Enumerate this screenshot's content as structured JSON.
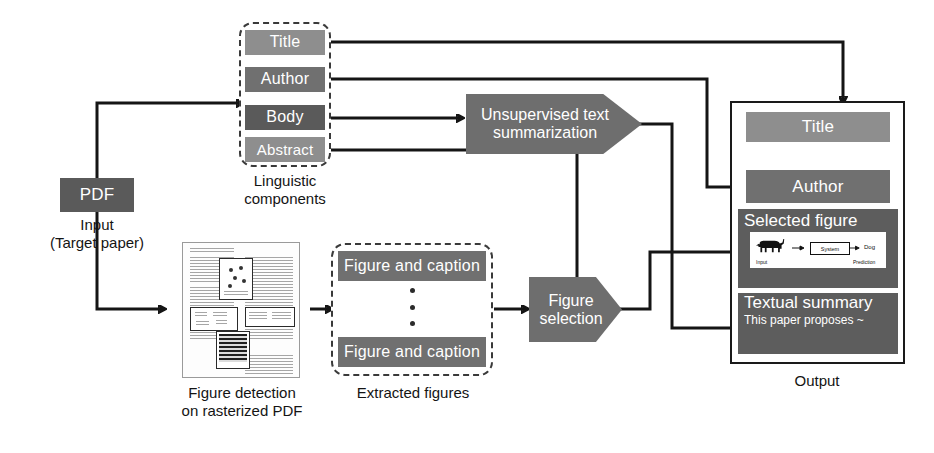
{
  "diagram": {
    "input": {
      "pdf_label": "PDF",
      "caption": "Input\n(Target paper)"
    },
    "linguistic": {
      "caption": "Linguistic\ncomponents",
      "components": [
        {
          "label": "Title",
          "color": "#8e8e8e"
        },
        {
          "label": "Author",
          "color": "#6f6f6f"
        },
        {
          "label": "Body",
          "color": "#565656"
        },
        {
          "label": "Abstract",
          "color": "#8e8e8e"
        }
      ]
    },
    "figure_detection": {
      "caption": "Figure detection\non rasterized PDF"
    },
    "extracted": {
      "caption": "Extracted figures",
      "items": [
        {
          "label": "Figure and caption"
        },
        {
          "label": "Figure and caption"
        }
      ],
      "ellipsis": "⋮"
    },
    "processes": [
      {
        "name": "summarization",
        "label": "Unsupervised text\nsummarization"
      },
      {
        "name": "figure-selection",
        "label": "Figure\nselection"
      }
    ],
    "output": {
      "caption": "Output",
      "rows": [
        {
          "name": "title",
          "label": "Title",
          "color": "#8e8e8e"
        },
        {
          "name": "author",
          "label": "Author",
          "color": "#6f6f6f"
        },
        {
          "name": "selected-figure",
          "label": "Selected figure",
          "color": "#5d5d5d"
        },
        {
          "name": "textual-summary",
          "label": "Textual summary",
          "color": "#5d5d5d",
          "body": "This paper proposes ~"
        }
      ],
      "selected_figure_inner": {
        "input_label": "Input",
        "system_label": "System",
        "prediction_label": "Prediction",
        "class_label": "Dog"
      }
    },
    "colors": {
      "stroke": "#151515",
      "page_bg": "#ffffff",
      "chip_light": "#8e8e8e",
      "chip_mid": "#6f6f6f",
      "chip_dark": "#565656"
    }
  }
}
